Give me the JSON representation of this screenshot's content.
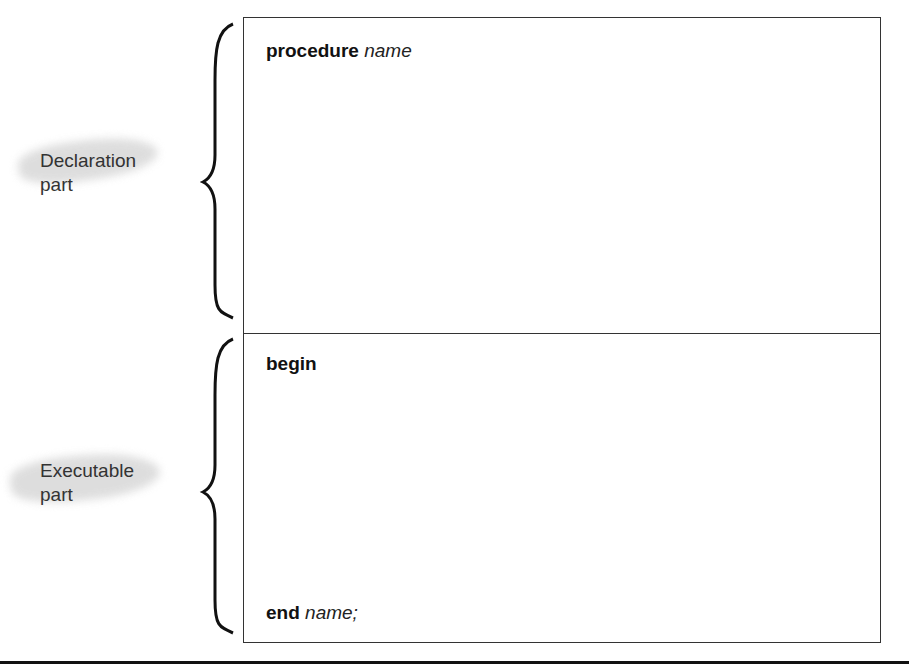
{
  "diagram": {
    "sections": [
      {
        "label_line1": "Declaration",
        "label_line2": "part",
        "header_keyword": "procedure",
        "header_name": "name"
      },
      {
        "label_line1": "Executable",
        "label_line2": "part",
        "header_keyword": "begin",
        "footer_keyword": "end",
        "footer_name": "name;"
      }
    ]
  }
}
